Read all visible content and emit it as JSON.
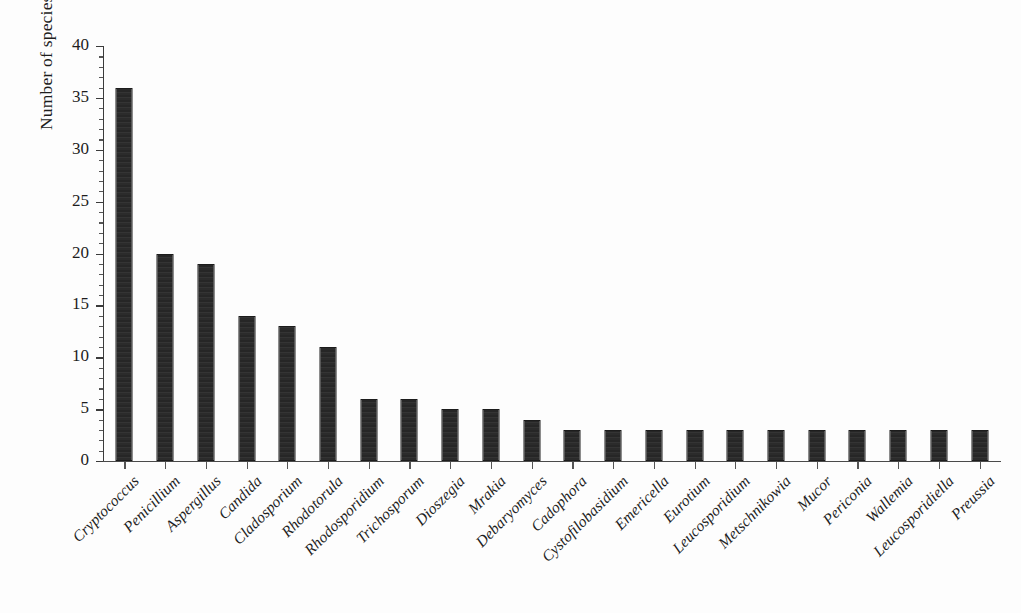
{
  "chart_data": {
    "type": "bar",
    "title": "",
    "xlabel": "",
    "ylabel": "Number of species",
    "ylim": [
      0,
      40
    ],
    "y_major_step": 5,
    "y_minor_step": 1,
    "grid": false,
    "legend": "none",
    "orientation": "vertical",
    "bar_color": "#2b2b2b",
    "categories": [
      "Cryptococcus",
      "Penicillium",
      "Aspergillus",
      "Candida",
      "Cladosporium",
      "Rhodotorula",
      "Rhodosporidium",
      "Trichosporum",
      "Dioszegia",
      "Mrakia",
      "Debaryomyces",
      "Cadophora",
      "Cystofilobasidium",
      "Emericella",
      "Eurotium",
      "Leucosporidium",
      "Metschnikowia",
      "Mucor",
      "Periconia",
      "Wallemia",
      "Leucosporidiella",
      "Preussia"
    ],
    "values": [
      36,
      20,
      19,
      14,
      13,
      11,
      6,
      6,
      5,
      5,
      4,
      3,
      3,
      3,
      3,
      3,
      3,
      3,
      3,
      3,
      3,
      3
    ],
    "y_tick_labels": [
      "0",
      "5",
      "10",
      "15",
      "20",
      "25",
      "30",
      "35",
      "40"
    ],
    "y_tick_values": [
      0,
      5,
      10,
      15,
      20,
      25,
      30,
      35,
      40
    ]
  },
  "axes": {
    "y_axis_title": "Number of species"
  }
}
